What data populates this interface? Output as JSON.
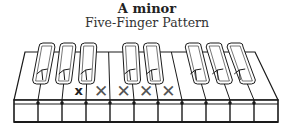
{
  "title": "A minor",
  "subtitle": "Five-Finger Pattern",
  "keyboard": {
    "white_key_count": 11,
    "black_key_groups": [
      3,
      2,
      3
    ],
    "marked_white_keys": [
      {
        "index": 2,
        "symbol": "x",
        "style": "root"
      },
      {
        "index": 3,
        "symbol": "✕",
        "style": "finger"
      },
      {
        "index": 4,
        "symbol": "✕",
        "style": "finger"
      },
      {
        "index": 5,
        "symbol": "✕",
        "style": "finger"
      },
      {
        "index": 6,
        "symbol": "✕",
        "style": "finger"
      }
    ],
    "colors": {
      "outline": "#1a1a1a",
      "mark": "#555555",
      "root_mark": "#222222",
      "fill": "#ffffff"
    }
  }
}
